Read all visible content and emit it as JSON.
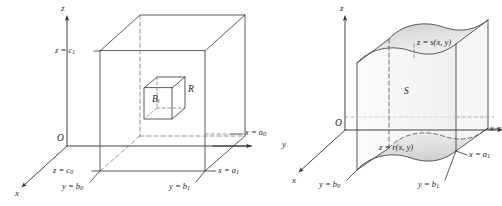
{
  "figure": {
    "panels": [
      {
        "id": "left",
        "name": "rectangular-box-partition",
        "description": "Rectangular box R subdivided, with sub-box B sub i highlighted",
        "region_label": "R",
        "subbox_label": "B",
        "subbox_sub": "i",
        "origin_label": "O",
        "axes": {
          "z": "z",
          "y": "y",
          "x": "x"
        },
        "bounds": [
          {
            "name": "z-upper",
            "lead": "z",
            "op": "=",
            "var": "c",
            "sub": "1"
          },
          {
            "name": "z-lower",
            "lead": "z",
            "op": "=",
            "var": "c",
            "sub": "0"
          },
          {
            "name": "y-lower",
            "lead": "y",
            "op": "=",
            "var": "b",
            "sub": "0"
          },
          {
            "name": "y-upper",
            "lead": "y",
            "op": "=",
            "var": "b",
            "sub": "1"
          },
          {
            "name": "x-near",
            "lead": "x",
            "op": "=",
            "var": "a",
            "sub": "0"
          },
          {
            "name": "x-far",
            "lead": "x",
            "op": "=",
            "var": "a",
            "sub": "1"
          }
        ]
      },
      {
        "id": "right",
        "name": "general-solid-between-surfaces",
        "description": "Solid S bounded above by z = s(x, y) and below by z = r(x, y)",
        "region_label": "S",
        "origin_label": "O",
        "axes": {
          "z": "z",
          "y": "y",
          "x": "x"
        },
        "surfaces": [
          {
            "name": "upper-surface",
            "text": "z = s(x, y)"
          },
          {
            "name": "lower-surface",
            "text": "z = r(x, y)"
          }
        ],
        "bounds": [
          {
            "name": "y-lower",
            "lead": "y",
            "op": "=",
            "var": "b",
            "sub": "0"
          },
          {
            "name": "y-upper",
            "lead": "y",
            "op": "=",
            "var": "b",
            "sub": "1"
          },
          {
            "name": "x-near",
            "lead": "x",
            "op": "=",
            "var": "a",
            "sub": "0"
          },
          {
            "name": "x-far",
            "lead": "x",
            "op": "=",
            "var": "a",
            "sub": "1"
          }
        ]
      }
    ],
    "colors": {
      "stroke": "#3c3c3c",
      "dashed": "#7a7a7a",
      "text": "#231f20",
      "surface_fill_light": "#ededed",
      "surface_fill_mid": "#d8d8d8",
      "background": "#ffffff"
    }
  },
  "labels": {
    "z_eq_c1": "z = c",
    "z_eq_c0": "z = c",
    "y_eq_b0": "y = b",
    "y_eq_b1": "y = b",
    "x_eq_a0": "x = a",
    "x_eq_a1": "x = a",
    "x_eq_trunc": "x =",
    "R": "R",
    "S": "S",
    "B": "B",
    "O": "O",
    "z_axis": "z",
    "y_axis": "y",
    "x_axis": "x",
    "z_eq_s": "z = s(x, y)",
    "z_eq_r": "z = r(x, y)",
    "sub_0": "0",
    "sub_1": "1",
    "sub_i": "i"
  }
}
